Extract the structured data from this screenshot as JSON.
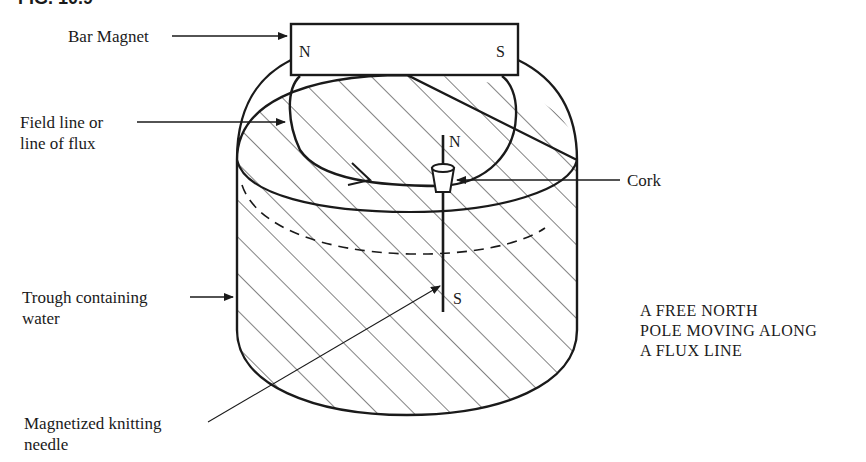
{
  "figure": {
    "caption_partial": "FIG. 10.9",
    "title_lines": [
      "A FREE NORTH",
      "POLE MOVING ALONG",
      "A FLUX LINE"
    ]
  },
  "labels": {
    "bar_magnet": "Bar Magnet",
    "field_line": [
      "Field line or",
      "line of flux"
    ],
    "cork": "Cork",
    "trough": [
      "Trough containing",
      "water"
    ],
    "needle": [
      "Magnetized knitting",
      "needle"
    ]
  },
  "poles": {
    "magnet_north": "N",
    "magnet_south": "S",
    "needle_north": "N",
    "needle_south": "S"
  },
  "colors": {
    "ink": "#1a1a1a",
    "background": "#ffffff"
  }
}
